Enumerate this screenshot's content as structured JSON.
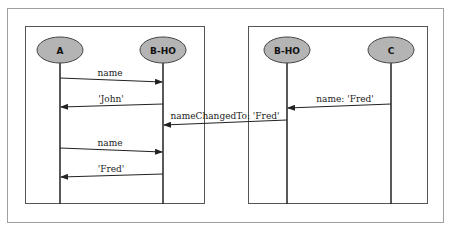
{
  "diagram": {
    "type": "sequence-diagram",
    "colors": {
      "outer_frame": "#a0a0a0",
      "panel_border": "#555555",
      "actor_fill": "#b4b4b4",
      "actor_stroke": "#444444",
      "line": "#222222"
    },
    "panels": [
      {
        "id": "left",
        "actors": [
          {
            "label": "A"
          },
          {
            "label": "B-HO"
          }
        ],
        "messages": [
          {
            "label": "name",
            "from": "A",
            "to": "B-HO"
          },
          {
            "label": "'John'",
            "from": "B-HO",
            "to": "A"
          },
          {
            "label": "name",
            "from": "A",
            "to": "B-HO"
          },
          {
            "label": "'Fred'",
            "from": "B-HO",
            "to": "A"
          }
        ]
      },
      {
        "id": "right",
        "actors": [
          {
            "label": "B-HO"
          },
          {
            "label": "C"
          }
        ],
        "messages": [
          {
            "label": "name: 'Fred'",
            "from": "C",
            "to": "B-HO"
          }
        ]
      }
    ],
    "cross_messages": [
      {
        "label": "nameChangedTo: 'Fred'",
        "from": "B-HO (right)",
        "to": "B-HO (left)"
      }
    ]
  }
}
